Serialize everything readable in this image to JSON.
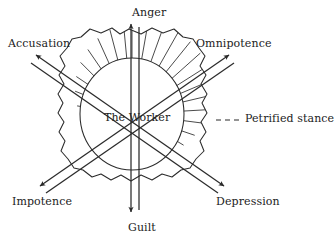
{
  "figure": {
    "center_label": "The Worker",
    "callout_label": "Petrified stance",
    "axes": [
      {
        "id": "vertical",
        "positive_label": "Anger",
        "negative_label": "Guilt"
      },
      {
        "id": "nw-se",
        "positive_label": "Accusation",
        "negative_label": "Depression"
      },
      {
        "id": "ne-sw",
        "positive_label": "Omnipotence",
        "negative_label": "Impotence"
      }
    ],
    "labels": {
      "anger": "Anger",
      "accusation": "Accusation",
      "omnipotence": "Omnipotence",
      "worker": "The Worker",
      "petrified": "Petrified stance",
      "impotence": "Impotence",
      "depression": "Depression",
      "guilt": "Guilt"
    },
    "colors": {
      "ink": "#222222",
      "stroke": "#2b2b2b",
      "background": "#ffffff"
    }
  }
}
